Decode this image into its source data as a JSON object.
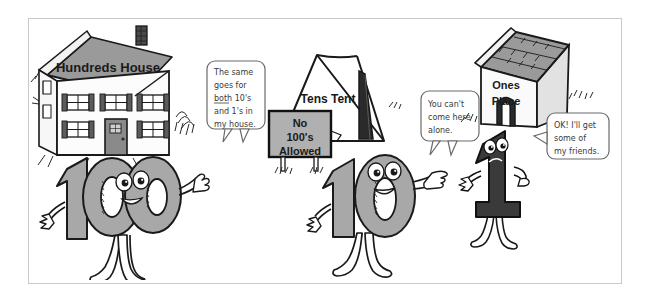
{
  "illustration": {
    "title": "Place Value Characters Cartoon",
    "colors": {
      "outline": "#1a1a1a",
      "body_gray": "#a8a8a8",
      "roof_gray": "#9a9a9a",
      "dark_char": "#3a3a3a",
      "sign_gray": "#b0b0b0",
      "frame": "#c9c9c9",
      "paper": "#ffffff"
    }
  },
  "scenes": [
    {
      "id": "hundreds",
      "building_label": "Hundreds House",
      "building_name": "house",
      "character_label": "100",
      "character_name": "hundreds-character",
      "speech": {
        "lines": [
          "The same",
          "goes for",
          "both 10's",
          "and 1's in",
          "my house."
        ],
        "underlined_word": "both"
      }
    },
    {
      "id": "tens",
      "building_label": "Tens Tent",
      "building_name": "tent",
      "character_label": "10",
      "character_name": "tens-character",
      "sign": {
        "lines": [
          "No",
          "100's",
          "Allowed"
        ]
      },
      "speech": {
        "lines": [
          "You can't",
          "come here",
          "alone."
        ]
      }
    },
    {
      "id": "ones",
      "building_label_line1": "Ones",
      "building_label_line2": "Place",
      "building_name": "doghouse",
      "character_label": "1",
      "character_name": "ones-character",
      "speech": {
        "lines": [
          "OK! I'll get",
          "some of",
          "my friends."
        ]
      }
    }
  ]
}
